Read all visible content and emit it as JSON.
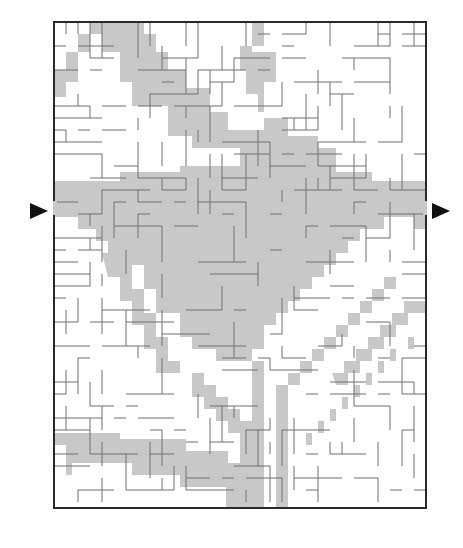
{
  "puzzle": {
    "type": "maze",
    "title": "Maze puzzle",
    "colors": {
      "background": "#ffffff",
      "path_shade": "#c8c8c8",
      "wall": "#6e6e6e",
      "border": "#2a2a2a",
      "arrow": "#111111"
    },
    "entry_arrow": {
      "side": "left",
      "icon": "arrow-right-icon"
    },
    "exit_arrow": {
      "side": "right",
      "icon": "arrow-right-icon"
    },
    "grid": {
      "cols": 31,
      "rows": 40,
      "cell": 12,
      "left": 54,
      "top": 22
    }
  }
}
